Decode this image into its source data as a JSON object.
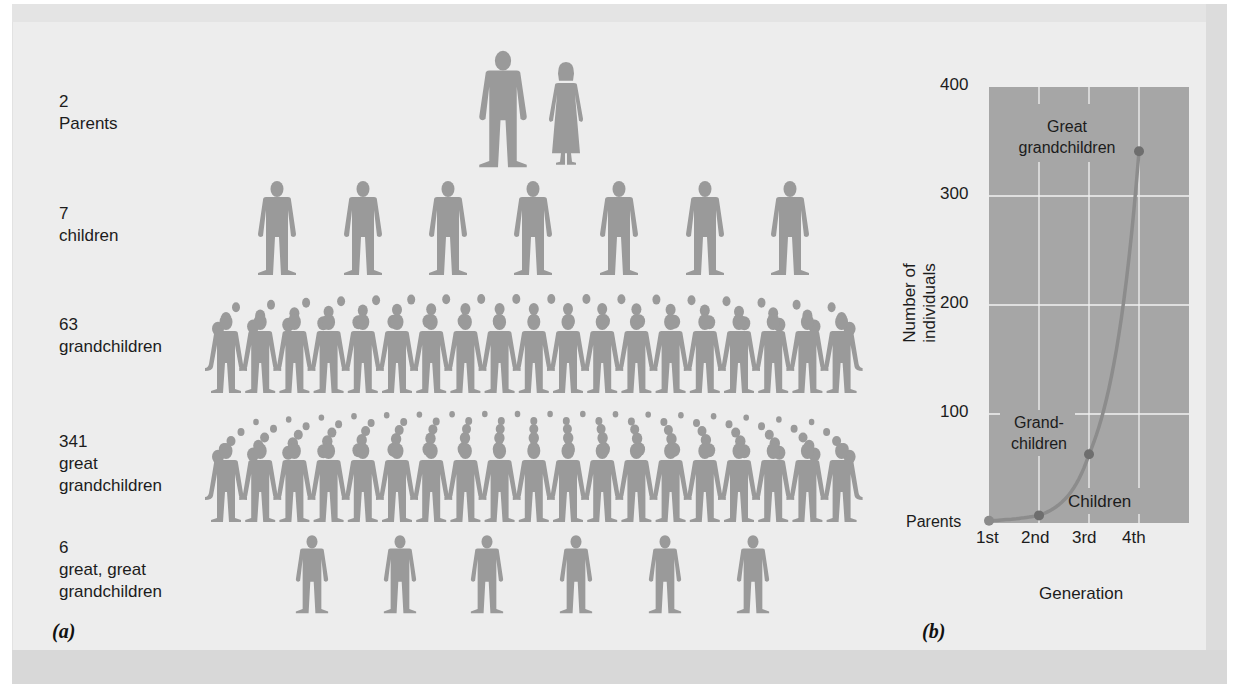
{
  "figure": {
    "panel_a_letter": "(a)",
    "panel_b_letter": "(b)",
    "colors": {
      "background": "#ededed",
      "figure_gray": "#9a9a9a",
      "plot_area": "#a6a6a6",
      "gridline": "#f2f2f2",
      "curve": "#8a8a8a",
      "point": "#6e6e6e",
      "text": "#1c1c1c"
    }
  },
  "panel_a": {
    "rows": [
      {
        "count": "2",
        "label": "Parents",
        "icons": "man-and-woman",
        "icon_count": 2
      },
      {
        "count": "7",
        "label": "children",
        "icons": "person",
        "icon_count": 7
      },
      {
        "count": "63",
        "label": "grandchildren",
        "icons": "crowd-holding-hands",
        "icon_count": 19
      },
      {
        "count": "341",
        "label": "great",
        "label2": "grandchildren",
        "icons": "crowd-holding-hands",
        "icon_count": 19
      },
      {
        "count": "6",
        "label": "great, great",
        "label2": "grandchildren",
        "icons": "person",
        "icon_count": 6
      }
    ]
  },
  "chart_data": {
    "type": "line",
    "title": "",
    "xlabel": "Generation",
    "ylabel": "Number of individuals",
    "categories": [
      "1st",
      "2nd",
      "3rd",
      "4th"
    ],
    "x_tick_labels": [
      "1st",
      "2nd",
      "3rd",
      "4th"
    ],
    "y_ticks": [
      100,
      200,
      300,
      400
    ],
    "ylim": [
      0,
      400
    ],
    "grid": true,
    "series": [
      {
        "name": "Number of individuals",
        "values": [
          2,
          7,
          63,
          341
        ]
      }
    ],
    "point_labels": [
      "Parents",
      "Children",
      "Grand-children",
      "Great grandchildren"
    ],
    "annotations": [
      {
        "text": "Parents",
        "line1": "Parents"
      },
      {
        "text": "Children",
        "line1": "Children"
      },
      {
        "text": "Grand-children",
        "line1": "Grand-",
        "line2": "children"
      },
      {
        "text": "Great grandchildren",
        "line1": "Great",
        "line2": "grandchildren"
      }
    ]
  }
}
